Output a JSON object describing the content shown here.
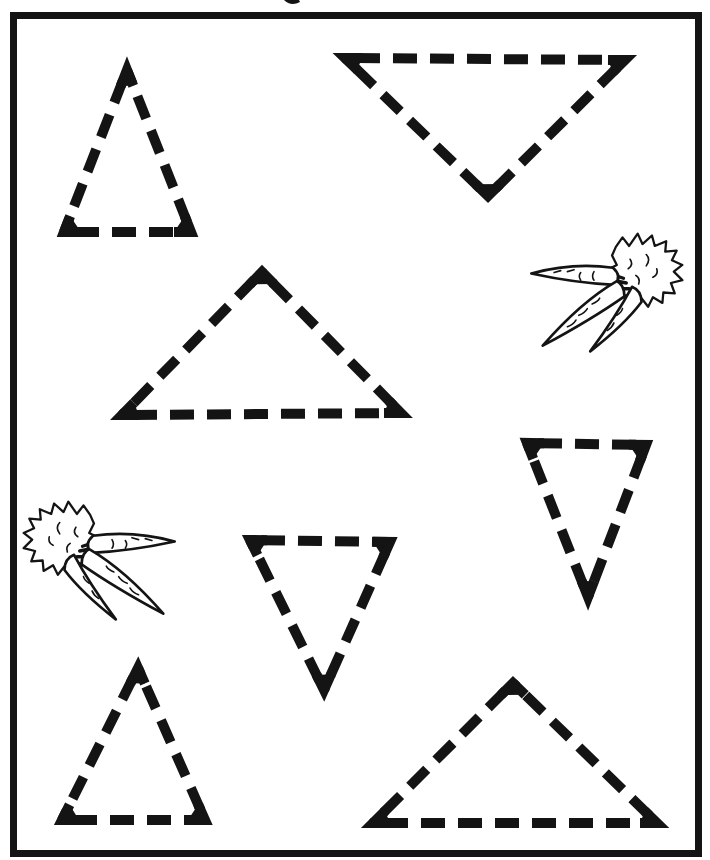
{
  "page": {
    "background_color": "#ffffff",
    "ink_color": "#141414"
  },
  "border_frame": {
    "x": 13.5,
    "y": 15.5,
    "width": 685,
    "height": 838,
    "thickness": 7
  },
  "stroke_style": {
    "thickness": 10,
    "dash_length": 24,
    "dash_gap": 13,
    "dash_offset": 26,
    "corner_mark_length": 17
  },
  "triangles": [
    {
      "id": "top-left",
      "orientation": "up",
      "vertices": [
        [
          127,
          70
        ],
        [
          64,
          232
        ],
        [
          191,
          232
        ]
      ]
    },
    {
      "id": "top-right",
      "orientation": "down",
      "vertices": [
        [
          345,
          58
        ],
        [
          625,
          60
        ],
        [
          488,
          196
        ]
      ]
    },
    {
      "id": "middle-left",
      "orientation": "up",
      "vertices": [
        [
          262,
          272
        ],
        [
          122,
          415
        ],
        [
          401,
          413
        ]
      ]
    },
    {
      "id": "middle-right",
      "orientation": "down",
      "vertices": [
        [
          527,
          443
        ],
        [
          646,
          445
        ],
        [
          588,
          597
        ]
      ]
    },
    {
      "id": "center",
      "orientation": "down",
      "vertices": [
        [
          250,
          540
        ],
        [
          390,
          542
        ],
        [
          324,
          690
        ]
      ]
    },
    {
      "id": "bottom-left",
      "orientation": "up",
      "vertices": [
        [
          138,
          668
        ],
        [
          62,
          820
        ],
        [
          205,
          820
        ]
      ]
    },
    {
      "id": "bottom-right",
      "orientation": "up",
      "vertices": [
        [
          513,
          683
        ],
        [
          373,
          823
        ],
        [
          657,
          823
        ]
      ]
    }
  ],
  "illustrations": [
    {
      "id": "carrot-bunch-right",
      "type": "carrot-bunch",
      "x": 518,
      "y": 226,
      "scale": 0.95,
      "mirrored": false
    },
    {
      "id": "carrot-bunch-left",
      "type": "carrot-bunch",
      "x": 188,
      "y": 494,
      "scale": 0.95,
      "mirrored": true
    }
  ]
}
